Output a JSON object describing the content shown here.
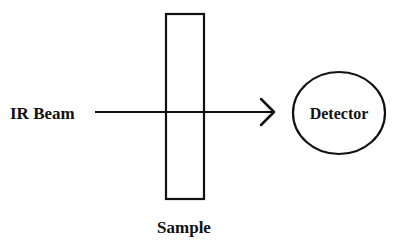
{
  "diagram": {
    "labels": {
      "source": "IR Beam",
      "sample": "Sample",
      "detector": "Detector"
    },
    "colors": {
      "stroke": "#111111",
      "background": "#ffffff"
    },
    "elements": [
      {
        "id": "ir-beam",
        "type": "arrow",
        "label": "IR Beam"
      },
      {
        "id": "sample",
        "type": "rectangle",
        "label": "Sample"
      },
      {
        "id": "detector",
        "type": "ellipse",
        "label": "Detector"
      }
    ]
  }
}
